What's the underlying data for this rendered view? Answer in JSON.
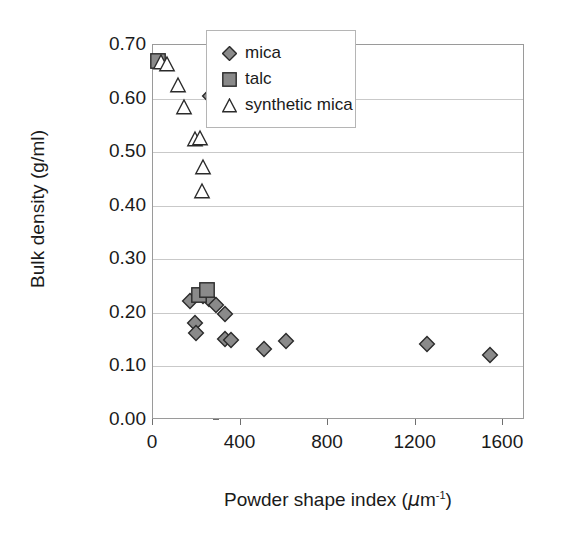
{
  "chart_data": {
    "type": "scatter",
    "title": "",
    "xlabel": "Powder shape index (μm⁻¹)",
    "xlabel_text": "Powder shape index (",
    "xlabel_unit": "m",
    "xlabel_exp": "-1",
    "xlabel_tail": ")",
    "ylabel": "Bulk density (g/ml)",
    "xlim": [
      0,
      1700
    ],
    "ylim": [
      0.0,
      0.7
    ],
    "xticks": [
      0,
      400,
      800,
      1200,
      1600
    ],
    "xtick_labels": [
      "0",
      "400",
      "800",
      "1200",
      "1600"
    ],
    "yticks": [
      0.0,
      0.1,
      0.2,
      0.3,
      0.4,
      0.5,
      0.6,
      0.7
    ],
    "ytick_labels": [
      "0.00",
      "0.10",
      "0.20",
      "0.30",
      "0.40",
      "0.50",
      "0.60",
      "0.70"
    ],
    "grid": "horizontal",
    "legend_position": "top-right-inside",
    "marker_fill": "#8a8a8a",
    "marker_edge": "#2b2b2b",
    "series": [
      {
        "name": "mica",
        "marker": "diamond",
        "fill": "#8a8a8a",
        "edge": "#2b2b2b",
        "points": [
          {
            "x": 262,
            "y": 0.605
          },
          {
            "x": 170,
            "y": 0.222
          },
          {
            "x": 228,
            "y": 0.232
          },
          {
            "x": 255,
            "y": 0.225
          },
          {
            "x": 290,
            "y": 0.215
          },
          {
            "x": 190,
            "y": 0.182
          },
          {
            "x": 196,
            "y": 0.162
          },
          {
            "x": 330,
            "y": 0.152
          },
          {
            "x": 356,
            "y": 0.15
          },
          {
            "x": 330,
            "y": 0.198
          },
          {
            "x": 505,
            "y": 0.133
          },
          {
            "x": 610,
            "y": 0.148
          },
          {
            "x": 1250,
            "y": 0.142
          },
          {
            "x": 1540,
            "y": 0.122
          }
        ]
      },
      {
        "name": "talc",
        "marker": "square",
        "fill": "#8a8a8a",
        "edge": "#2b2b2b",
        "points": [
          {
            "x": 22,
            "y": 0.67
          },
          {
            "x": 212,
            "y": 0.233
          },
          {
            "x": 245,
            "y": 0.243
          }
        ]
      },
      {
        "name": "synthetic mica",
        "marker": "triangle",
        "fill": "#ffffff",
        "edge": "#2b2b2b",
        "points": [
          {
            "x": 36,
            "y": 0.668
          },
          {
            "x": 62,
            "y": 0.665
          },
          {
            "x": 112,
            "y": 0.625
          },
          {
            "x": 142,
            "y": 0.585
          },
          {
            "x": 190,
            "y": 0.525
          },
          {
            "x": 216,
            "y": 0.527
          },
          {
            "x": 230,
            "y": 0.473
          },
          {
            "x": 222,
            "y": 0.428
          }
        ]
      }
    ]
  },
  "legend": {
    "items": [
      {
        "label": "mica",
        "marker": "diamond-icon"
      },
      {
        "label": "talc",
        "marker": "square-icon"
      },
      {
        "label": "synthetic mica",
        "marker": "triangle-icon"
      }
    ]
  }
}
